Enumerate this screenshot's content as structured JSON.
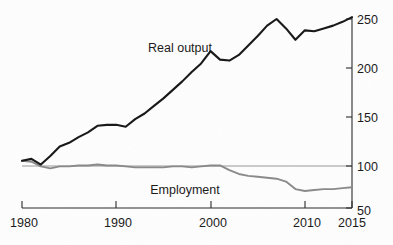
{
  "chart_data": {
    "type": "line",
    "title": "",
    "subtitle": "",
    "xlabel": "",
    "ylabel": "",
    "index_base": 100,
    "xlim": [
      1980,
      2015
    ],
    "ylim": [
      50,
      255
    ],
    "yticks": [
      50,
      100,
      150,
      200,
      250
    ],
    "ytick_labels": [
      "50",
      "100",
      "150",
      "200",
      "250"
    ],
    "xticks": [
      1980,
      1990,
      2000,
      2010,
      2015
    ],
    "xtick_labels": [
      "1980",
      "1990",
      "2000",
      "2010",
      "2015"
    ],
    "grid": "single horizontal reference line at 100",
    "legend_position": "inline annotations on plot",
    "y_axis_side": "right",
    "annotations": [
      {
        "name": "real-output-label",
        "text": "Real output",
        "x_px": 180,
        "y_px": 52
      },
      {
        "name": "employment-label",
        "text": "Employment",
        "x_px": 185,
        "y_px": 194
      }
    ],
    "x": [
      1980,
      1981,
      1982,
      1983,
      1984,
      1985,
      1986,
      1987,
      1988,
      1989,
      1990,
      1991,
      1992,
      1993,
      1994,
      1995,
      1996,
      1997,
      1998,
      1999,
      2000,
      2001,
      2002,
      2003,
      2004,
      2005,
      2006,
      2007,
      2008,
      2009,
      2010,
      2011,
      2012,
      2013,
      2014,
      2015
    ],
    "series": [
      {
        "name": "Real output",
        "color": "#181818",
        "values": [
          100,
          102,
          96,
          105,
          115,
          119,
          125,
          130,
          137,
          138,
          138,
          136,
          144,
          150,
          158,
          166,
          175,
          184,
          194,
          203,
          216,
          207,
          206,
          212,
          222,
          232,
          243,
          250,
          240,
          228,
          238,
          237,
          240,
          243,
          247,
          252
        ]
      },
      {
        "name": "Employment",
        "color": "#8a8a8a",
        "values": [
          100,
          99,
          94,
          92,
          94,
          94,
          95,
          95,
          96,
          95,
          95,
          94,
          93,
          93,
          93,
          93,
          94,
          94,
          93,
          94,
          95,
          95,
          90,
          86,
          84,
          83,
          82,
          81,
          78,
          70,
          68,
          69,
          70,
          70,
          71,
          72
        ]
      }
    ]
  },
  "axes": {
    "y_axis_name": "right-value-axis",
    "x_axis_name": "bottom-year-axis"
  }
}
